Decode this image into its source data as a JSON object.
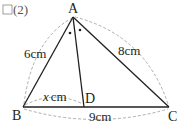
{
  "problem": {
    "checkbox": "□",
    "number": "(2)"
  },
  "points": {
    "A": {
      "label": "A",
      "x": 73,
      "y": 17
    },
    "B": {
      "label": "B",
      "x": 23,
      "y": 107
    },
    "C": {
      "label": "C",
      "x": 169,
      "y": 107
    },
    "D": {
      "label": "D",
      "x": 84,
      "y": 107
    }
  },
  "segments": {
    "AB": {
      "label": "6cm"
    },
    "AC": {
      "label": "8cm"
    },
    "BC": {
      "label": "9cm"
    },
    "BD": {
      "label_var": "x",
      "label_unit": "cm"
    }
  },
  "angle_marks": "two equal angles at A (bisector AD)",
  "colors": {
    "line": "#231f20",
    "dashed": "#999999"
  }
}
